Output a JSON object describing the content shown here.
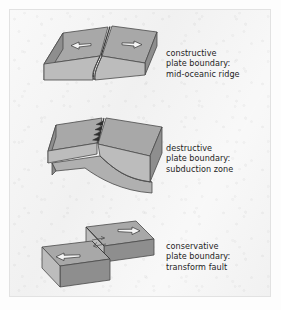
{
  "figure": {
    "background_color": "#f2f2f2",
    "border_color": "#e2e2e2",
    "text_color": "#242424",
    "block_top_color": "#a6a6a6",
    "block_front_color": "#b8b8b8",
    "block_side_color": "#909090",
    "outline_color": "#4a4a4a",
    "arrow_fill": "#f4f4f4",
    "arrow_outline": "#3c3c3c"
  },
  "panels": [
    {
      "id": "constructive",
      "diagram_name": "constructive-plate-boundary-diagram",
      "caption_lines": [
        "constructive",
        "plate boundary:",
        "mid-oceanic ridge"
      ],
      "arrows": [
        {
          "name": "left-divergence-arrow",
          "direction": "left"
        },
        {
          "name": "right-divergence-arrow",
          "direction": "right"
        }
      ],
      "features": [
        "rift valley",
        "median ridge line",
        "two diverging plates"
      ]
    },
    {
      "id": "destructive",
      "diagram_name": "destructive-plate-boundary-diagram",
      "caption_lines": [
        "destructive",
        "plate boundary:",
        "subduction zone"
      ],
      "arrows": [],
      "features": [
        "sawtooth trench line",
        "subducting slab",
        "overriding plate"
      ]
    },
    {
      "id": "conservative",
      "diagram_name": "conservative-plate-boundary-diagram",
      "caption_lines": [
        "conservative",
        "plate boundary:",
        "transform fault"
      ],
      "arrows": [
        {
          "name": "upper-block-slip-arrow",
          "direction": "right"
        },
        {
          "name": "lower-block-slip-arrow",
          "direction": "left"
        },
        {
          "name": "small-shear-arrow-right",
          "direction": "right"
        },
        {
          "name": "small-shear-arrow-left",
          "direction": "left"
        }
      ],
      "features": [
        "offset blocks",
        "strike-slip fault line",
        "opposing motion"
      ]
    }
  ]
}
